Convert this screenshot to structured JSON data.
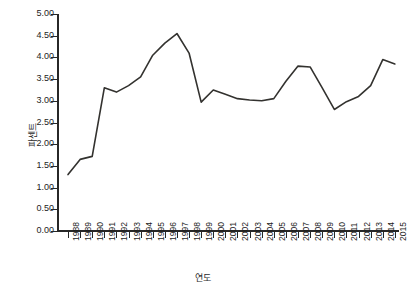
{
  "chart_data": {
    "type": "line",
    "title": "",
    "xlabel": "연도",
    "ylabel": "파센트",
    "xlim": [
      1988,
      2015
    ],
    "ylim": [
      0.0,
      5.0
    ],
    "grid": false,
    "legend": "none",
    "categories": [
      "1988",
      "1989",
      "1990",
      "1991",
      "1992",
      "1993",
      "1994",
      "1995",
      "1996",
      "1997",
      "1998",
      "1999",
      "2000",
      "2001",
      "2002",
      "2003",
      "2004",
      "2005",
      "2006",
      "2007",
      "2008",
      "2009",
      "2010",
      "2011",
      "2012",
      "2013",
      "2014",
      "2015"
    ],
    "values": [
      1.3,
      1.65,
      1.72,
      3.3,
      3.2,
      3.35,
      3.55,
      4.05,
      4.33,
      4.55,
      4.1,
      2.97,
      3.25,
      3.15,
      3.05,
      3.02,
      3.0,
      3.05,
      3.45,
      3.8,
      3.78,
      3.3,
      2.8,
      2.98,
      3.1,
      3.35,
      3.95,
      3.85
    ],
    "y_ticks": [
      "0.00",
      "0.50",
      "1.00",
      "1.50",
      "2.00",
      "2.50",
      "3.00",
      "3.50",
      "4.00",
      "4.50",
      "5.00"
    ],
    "y_tick_values": [
      0.0,
      0.5,
      1.0,
      1.5,
      2.0,
      2.5,
      3.0,
      3.5,
      4.0,
      4.5,
      5.0
    ],
    "series_color": "#33322f",
    "axis_color": "#272727",
    "line_width": 1.6
  }
}
